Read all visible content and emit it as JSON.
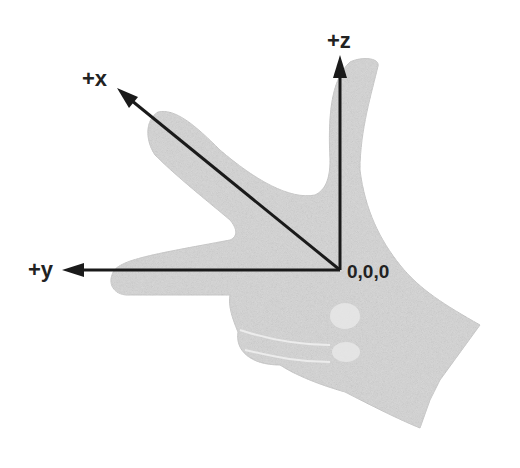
{
  "diagram": {
    "origin_label": "0,0,0",
    "axes": [
      {
        "name": "x",
        "label": "+x"
      },
      {
        "name": "y",
        "label": "+y"
      },
      {
        "name": "z",
        "label": "+z"
      }
    ],
    "colors": {
      "hand": "#d9d9d9",
      "arrow": "#1a1a1a",
      "text": "#222222"
    }
  }
}
